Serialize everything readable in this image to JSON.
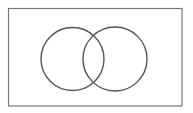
{
  "diagram": {
    "type": "venn",
    "universe": {
      "x": 8.5,
      "y": 8.5,
      "width": 173.5,
      "height": 97.5,
      "stroke": "#777777"
    },
    "sets": [
      {
        "name": "A",
        "cx": 72.5,
        "cy": 59,
        "r": 31.5,
        "stroke": "#555555"
      },
      {
        "name": "B",
        "cx": 115,
        "cy": 59,
        "r": 32,
        "stroke": "#555555"
      }
    ],
    "labels": []
  }
}
